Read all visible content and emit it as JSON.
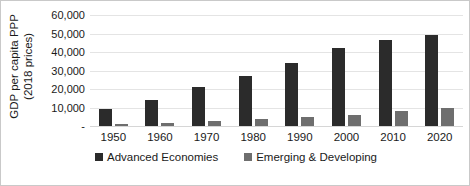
{
  "chart_data": {
    "type": "bar",
    "title": "",
    "subtitle": "",
    "xlabel": "",
    "ylabel_lines": [
      "GDP per capita PPP",
      "(2018 prices)"
    ],
    "ylabel": "GDP per capita PPP (2018 prices)",
    "categories": [
      "1950",
      "1960",
      "1970",
      "1980",
      "1990",
      "2000",
      "2010",
      "2020"
    ],
    "series": [
      {
        "name": "Advanced Economies",
        "color": "#2b2b2b",
        "values": [
          9000,
          14000,
          21000,
          27000,
          34000,
          42000,
          46500,
          49000
        ]
      },
      {
        "name": "Emerging & Developing",
        "color": "#6e6e6e",
        "values": [
          1200,
          1800,
          2800,
          3800,
          4800,
          6000,
          8000,
          10000
        ]
      }
    ],
    "ylim": [
      0,
      60000
    ],
    "ytick_values": [
      0,
      10000,
      20000,
      30000,
      40000,
      50000,
      60000
    ],
    "ytick_labels": [
      "-",
      "10,000",
      "20,000",
      "30,000",
      "40,000",
      "50,000",
      "60,000"
    ],
    "grid": true,
    "grid_axis": "y",
    "legend_position": "bottom",
    "border": true,
    "border_color": "#c9c9c9",
    "gridline_color": "#e4e4e4",
    "background": "#ffffff"
  }
}
